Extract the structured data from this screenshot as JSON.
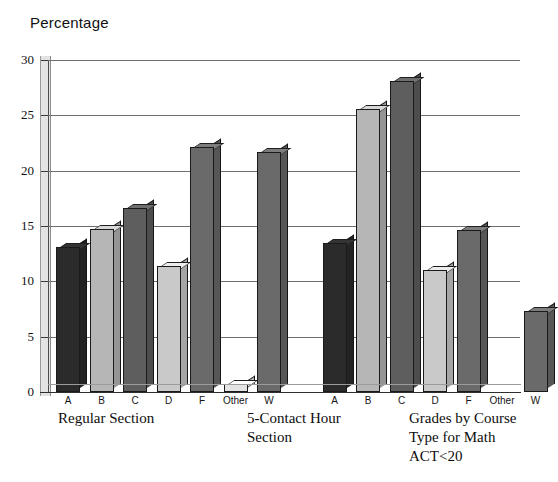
{
  "chart_data": {
    "type": "bar",
    "title": "Percentage",
    "xlabel": "",
    "ylabel": "Percentage",
    "ylim": [
      0,
      30
    ],
    "ytick_values": [
      0,
      5,
      10,
      15,
      20,
      25,
      30
    ],
    "ytick_labels": [
      "0",
      "5",
      "10",
      "15",
      "20",
      "25",
      "30"
    ],
    "grid": true,
    "legend_position": "none",
    "categories": [
      "A",
      "B",
      "C",
      "D",
      "F",
      "Other",
      "W"
    ],
    "groups": [
      {
        "name": "Regular Section",
        "caption": "Regular Section",
        "values": [
          13.1,
          14.7,
          16.6,
          11.4,
          22.1,
          0.7,
          21.7
        ]
      },
      {
        "name": "5-Contact Hour Section",
        "caption": "5-Contact Hour\nSection",
        "values": [
          13.5,
          25.6,
          28.1,
          11.0,
          14.6,
          0,
          7.3
        ]
      }
    ],
    "annotation": "Grades by Course\nType for Math\nACT<20",
    "bar_shades": {
      "A": "#2b2b2b",
      "B": "#b6b6b6",
      "C": "#5e5e5e",
      "D": "#c9c9c9",
      "F": "#6a6a6a",
      "Other": "#e4e4e4",
      "W": "#6a6a6a"
    }
  },
  "axis": {
    "ticks": [
      {
        "label": "30",
        "value": 30
      },
      {
        "label": "25",
        "value": 25
      },
      {
        "label": "20",
        "value": 20
      },
      {
        "label": "15",
        "value": 15
      },
      {
        "label": "10",
        "value": 10
      },
      {
        "label": "5",
        "value": 5
      },
      {
        "label": "0",
        "value": 0
      }
    ]
  },
  "captions": {
    "group1": "Regular Section",
    "group2_line1": "5-Contact Hour",
    "group2_line2": "Section",
    "note_line1": "Grades by Course",
    "note_line2": "Type for Math",
    "note_line3": "ACT<20"
  },
  "title": "Percentage"
}
